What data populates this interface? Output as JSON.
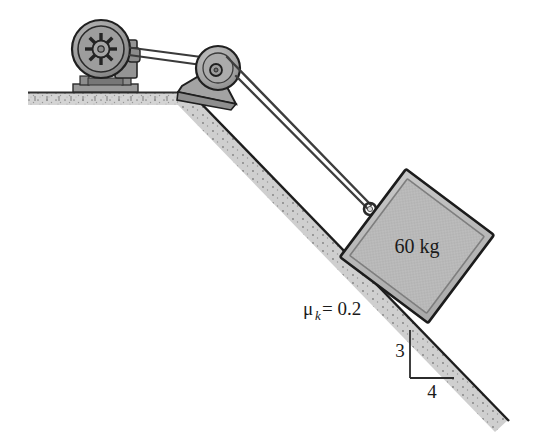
{
  "figure": {
    "labels": {
      "block_mass": "60 kg",
      "friction_symbol": "μ",
      "friction_subscript": "k",
      "friction_equals_value": " = 0.2",
      "friction_full": "μ_k = 0.2",
      "slope_rise": "3",
      "slope_run": "4"
    },
    "colors": {
      "outline": "#1a1a1a",
      "block_fill": "#b9b9b9",
      "block_edge": "#8f8f8f",
      "ground_fill": "#c6c6c6",
      "ground_line": "#3a3a3a",
      "incline_fill": "#d2d2d2",
      "incline_line": "#222222",
      "motor_fill": "#a8a8a8",
      "motor_dark": "#6d6d6d",
      "pulley_fill": "#b0b0b0",
      "bracket_fill": "#a5a5a5",
      "cable": "#3d3d3d",
      "background": "#ffffff"
    },
    "parts": {
      "motor": "motor-with-spoked-drive-wheel",
      "motor_base": "motor-base-plate",
      "belt": "drive-belt",
      "pulley": "top-pulley",
      "bracket": "pulley-support-bracket",
      "cable": "hoist-cable",
      "hook": "cable-hook-eyebolt",
      "block": "block-60kg",
      "ground": "horizontal-ground",
      "incline": "inclined-surface",
      "slope_triangle": "slope-ratio-triangle"
    },
    "geometry": {
      "incline_angle_deg": 36.87,
      "slope_ratio": "3:4",
      "incline_top": [
        190,
        92
      ],
      "incline_bottom": [
        508,
        422
      ],
      "ground_left": [
        28,
        92
      ],
      "ground_right": [
        190,
        92
      ]
    }
  }
}
